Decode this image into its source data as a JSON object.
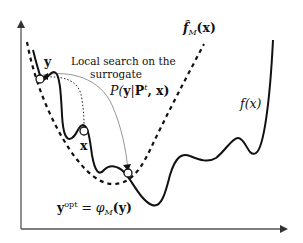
{
  "diagram": {
    "labels": {
      "surrogate_fn": "f̂",
      "surrogate_sub": "M",
      "surrogate_arg": "(x)",
      "true_fn": "f(x)",
      "y_point": "y",
      "x_point": "x",
      "local_search_line1": "Local search on the",
      "local_search_line2": "surrogate",
      "prob_P": "P(",
      "prob_y": "y",
      "prob_bar": "|",
      "prob_Pt": "P",
      "prob_t": "t",
      "prob_rest": ", x)",
      "yopt_y": "y",
      "yopt_sup": "opt",
      "yopt_eq": " = ",
      "yopt_phi": "φ",
      "yopt_M": "M",
      "yopt_arg": "(y)"
    },
    "curves": [
      {
        "name": "true-function",
        "style": "solid-thick"
      },
      {
        "name": "surrogate-function",
        "style": "dashed-thick"
      },
      {
        "name": "sampling-distribution-arc",
        "style": "solid-thin-gray"
      },
      {
        "name": "local-search-path",
        "style": "dotted"
      }
    ],
    "points": [
      {
        "name": "y",
        "x": 40,
        "y": 79
      },
      {
        "name": "x",
        "x": 84,
        "y": 131
      },
      {
        "name": "y-opt",
        "x": 128,
        "y": 173
      }
    ],
    "colors": {
      "stroke": "#111111",
      "thin": "#888888",
      "background": "#ffffff"
    }
  }
}
